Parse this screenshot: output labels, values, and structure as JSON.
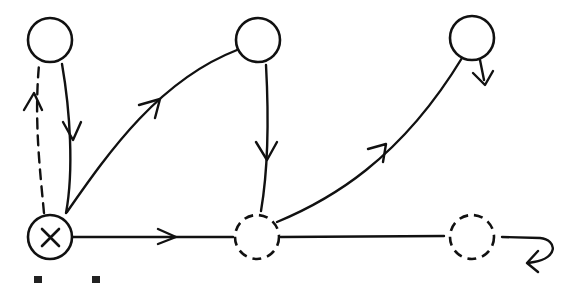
{
  "diagram": {
    "type": "state-transition-graph",
    "style": "hand-drawn black ink on white",
    "colors": {
      "ink": "#111111",
      "background": "#ffffff"
    },
    "nodes": [
      {
        "id": "top-left",
        "shape": "circle",
        "border": "solid",
        "cx": 50,
        "cy": 40,
        "r": 22
      },
      {
        "id": "top-middle",
        "shape": "circle",
        "border": "solid",
        "cx": 258,
        "cy": 40,
        "r": 22
      },
      {
        "id": "top-right",
        "shape": "circle",
        "border": "solid",
        "cx": 472,
        "cy": 38,
        "r": 22
      },
      {
        "id": "bottom-left",
        "shape": "circle-with-x",
        "border": "solid",
        "cx": 50,
        "cy": 237,
        "r": 22
      },
      {
        "id": "bottom-middle",
        "shape": "circle",
        "border": "dashed",
        "cx": 257,
        "cy": 237,
        "r": 22
      },
      {
        "id": "bottom-right",
        "shape": "circle",
        "border": "dashed",
        "cx": 472,
        "cy": 237,
        "r": 22
      }
    ],
    "edges": [
      {
        "from": "bottom-left",
        "to": "top-left",
        "style": "dashed",
        "arrow": "up"
      },
      {
        "from": "top-left",
        "to": "bottom-left",
        "style": "solid",
        "arrow": "down"
      },
      {
        "from": "bottom-left",
        "to": "top-middle",
        "style": "solid",
        "arrow": "forward",
        "curved": true
      },
      {
        "from": "top-middle",
        "to": "bottom-middle",
        "style": "solid",
        "arrow": "down"
      },
      {
        "from": "bottom-middle",
        "to": "top-right",
        "style": "solid",
        "arrow": "forward",
        "curved": true
      },
      {
        "from": "top-right",
        "to": "out",
        "style": "solid",
        "arrow": "down-right-stub"
      },
      {
        "from": "bottom-left",
        "to": "bottom-middle",
        "style": "solid",
        "arrow": "right"
      },
      {
        "from": "bottom-middle",
        "to": "bottom-right",
        "style": "solid",
        "arrow": "none"
      },
      {
        "from": "bottom-right",
        "to": "out",
        "style": "solid",
        "arrow": "curl-back"
      }
    ]
  }
}
